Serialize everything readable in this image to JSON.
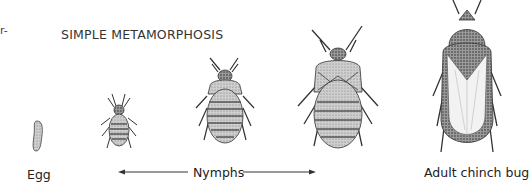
{
  "diagram": {
    "title": "SIMPLE METAMORPHOSIS",
    "cutoff_text": "r-",
    "stages": [
      {
        "id": "egg",
        "label": "Egg"
      },
      {
        "id": "nymph-1",
        "label": ""
      },
      {
        "id": "nymph-2",
        "label": ""
      },
      {
        "id": "nymph-3",
        "label": ""
      },
      {
        "id": "adult",
        "label": "Adult chinch bug"
      }
    ],
    "nymphs_label": "Nymphs",
    "colors": {
      "ink": "#222222",
      "shade": "#8a8a8a",
      "light": "#d8d8d8",
      "background": "#ffffff"
    }
  }
}
